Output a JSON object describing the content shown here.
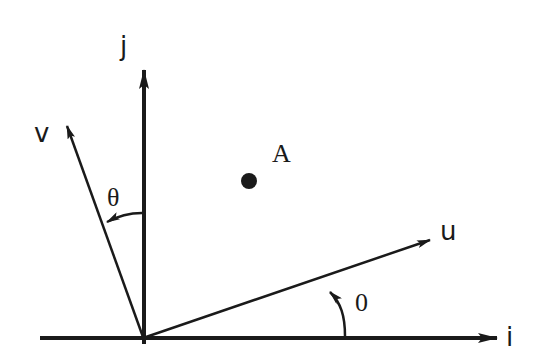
{
  "diagram": {
    "type": "coordinate-frame-rotation",
    "colors": {
      "stroke": "#1a1a1a",
      "background": "#ffffff"
    },
    "origin": {
      "x": 144,
      "y": 338
    },
    "axes": {
      "i": {
        "label": "i",
        "tip": {
          "x": 497,
          "y": 338
        }
      },
      "j": {
        "label": "j",
        "tip": {
          "x": 144,
          "y": 70
        }
      }
    },
    "vectors": {
      "u": {
        "label": "u",
        "tip": {
          "x": 430,
          "y": 240
        }
      },
      "v": {
        "label": "v",
        "tip": {
          "x": 67,
          "y": 126
        }
      }
    },
    "angles": {
      "u_from_i": {
        "label": "0"
      },
      "v_from_j": {
        "label": "θ"
      }
    },
    "point": {
      "label": "A",
      "x": 249,
      "y": 181
    }
  }
}
